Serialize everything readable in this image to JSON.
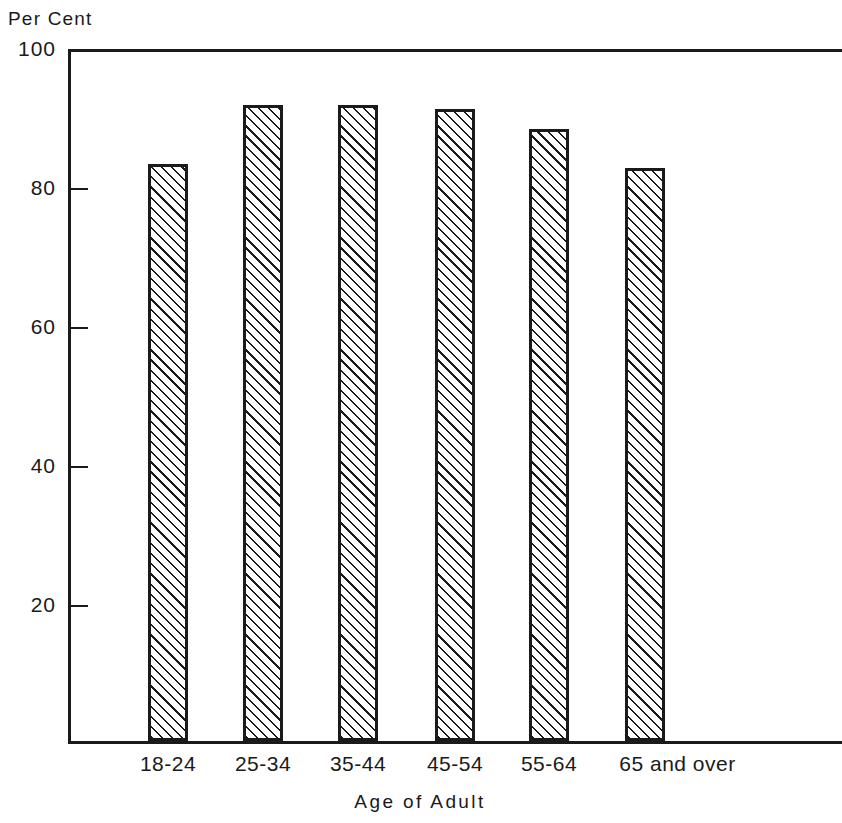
{
  "chart_data": {
    "type": "bar",
    "title": "",
    "subtitle": "",
    "xlabel": "Age of Adult",
    "ylabel": "Per Cent",
    "categories": [
      "18-24",
      "25-34",
      "35-44",
      "45-54",
      "55-64",
      "65 and over"
    ],
    "values": [
      83,
      91.5,
      91.5,
      91,
      88,
      82.5
    ],
    "series": [
      {
        "name": "Per Cent",
        "values": [
          83,
          91.5,
          91.5,
          91,
          88,
          82.5
        ]
      }
    ],
    "ylim": [
      0,
      100
    ],
    "yticks": [
      20,
      40,
      60,
      80,
      100
    ],
    "ytick_labels": [
      "20",
      "40",
      "60",
      "80",
      "100"
    ],
    "grid": false,
    "legend": null,
    "legend_position": "none",
    "annotations": [],
    "bar_style": {
      "fill": "diagonal-hatch",
      "edge_color": "#1a1a1a",
      "face_color": "#ffffff"
    },
    "axis_style": {
      "spines": [
        "left",
        "bottom",
        "top"
      ],
      "tick_direction": "in",
      "right_spine_cropped": true
    }
  },
  "figure": {
    "unit_caption": "Per Cent",
    "x_axis_title": "Age of Adult"
  }
}
